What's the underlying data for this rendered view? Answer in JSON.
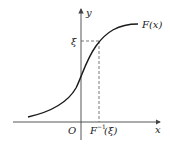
{
  "figure": {
    "type": "cdf-inverse-diagram",
    "labels": {
      "y_axis": "y",
      "x_axis": "x",
      "origin": "O",
      "curve": "F(x)",
      "xi": "ξ",
      "inverse_F": "F",
      "inverse_sup": "−1",
      "inverse_arg": "(ξ)"
    },
    "colors": {
      "axis": "#444444",
      "curve": "#1a1a1a",
      "dash": "#555555",
      "text": "#222222"
    }
  }
}
